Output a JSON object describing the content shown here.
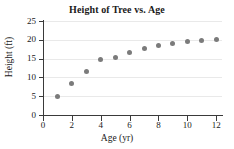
{
  "chart_data": {
    "type": "scatter",
    "title": "Height of Tree vs. Age",
    "xlabel": "Age (yr)",
    "ylabel": "Height (ft)",
    "xlim": [
      0,
      12.4
    ],
    "ylim": [
      0,
      25
    ],
    "grid": true,
    "legend": null,
    "marker_color": "#7b7b7b",
    "axis_color": "#3a3a3a",
    "grid_color": "#e9e9e9",
    "xticks": [
      0,
      2,
      4,
      6,
      8,
      10,
      12
    ],
    "xtick_labels": [
      "0",
      "2",
      "4",
      "6",
      "8",
      "10",
      "12"
    ],
    "yticks": [
      0,
      5,
      10,
      15,
      20,
      25
    ],
    "ytick_labels": [
      "0",
      "5",
      "10",
      "15",
      "20",
      "25"
    ],
    "x": [
      1,
      2,
      3,
      4,
      5,
      6,
      7,
      8,
      9,
      10,
      11,
      12
    ],
    "values": [
      5.0,
      8.4,
      11.7,
      14.8,
      15.4,
      16.5,
      17.6,
      18.4,
      19.0,
      19.5,
      19.8,
      20.1
    ],
    "points": [
      {
        "x": 1,
        "y": 5.0
      },
      {
        "x": 2,
        "y": 8.4
      },
      {
        "x": 3,
        "y": 11.7
      },
      {
        "x": 4,
        "y": 14.8
      },
      {
        "x": 5,
        "y": 15.4
      },
      {
        "x": 6,
        "y": 16.5
      },
      {
        "x": 7,
        "y": 17.6
      },
      {
        "x": 8,
        "y": 18.4
      },
      {
        "x": 9,
        "y": 19.0
      },
      {
        "x": 10,
        "y": 19.5
      },
      {
        "x": 11,
        "y": 19.8
      },
      {
        "x": 12,
        "y": 20.1
      }
    ]
  }
}
